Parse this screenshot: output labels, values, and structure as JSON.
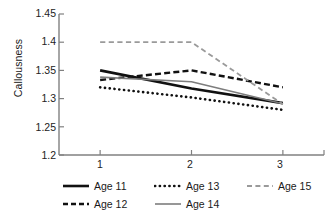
{
  "chart_data": {
    "type": "line",
    "title": "",
    "subtitle": "",
    "xlabel": "",
    "ylabel": "Callousness",
    "x": [
      1,
      2,
      3
    ],
    "categories": [
      "1",
      "2",
      "3"
    ],
    "xtick_labels": [
      "1",
      "2",
      "3"
    ],
    "ytick_labels": [
      "1.2",
      "1.25",
      "1.3",
      "1.35",
      "1.4",
      "1.45"
    ],
    "ytick_values": [
      1.2,
      1.25,
      1.3,
      1.35,
      1.4,
      1.45
    ],
    "ylim": [
      1.2,
      1.45
    ],
    "xlim": [
      0.55,
      3.45
    ],
    "grid": false,
    "legend_position": "bottom",
    "series": [
      {
        "name": "Age 11",
        "values": [
          1.35,
          1.318,
          1.292
        ],
        "color": "#111111",
        "style": "solid",
        "width": 2.6
      },
      {
        "name": "Age 12",
        "values": [
          1.333,
          1.35,
          1.32
        ],
        "color": "#111111",
        "style": "dashed",
        "width": 2.4
      },
      {
        "name": "Age 13",
        "values": [
          1.32,
          1.302,
          1.28
        ],
        "color": "#111111",
        "style": "dotted",
        "width": 2.6
      },
      {
        "name": "Age 14",
        "values": [
          1.338,
          1.33,
          1.291
        ],
        "color": "#7d7d7d",
        "style": "solid",
        "width": 1.6
      },
      {
        "name": "Age 15",
        "values": [
          1.4,
          1.4,
          1.29
        ],
        "color": "#9a9a9a",
        "style": "dashed",
        "width": 1.8
      }
    ]
  },
  "legend": {
    "rows": [
      [
        {
          "label": "Age 11",
          "swatch": "line-solid-black-thick"
        },
        {
          "label": "Age 13",
          "swatch": "line-dotted-black"
        },
        {
          "label": "Age 15",
          "swatch": "line-dashed-gray"
        }
      ],
      [
        {
          "label": "Age 12",
          "swatch": "line-dashed-black"
        },
        {
          "label": "Age 14",
          "swatch": "line-solid-gray"
        }
      ]
    ]
  },
  "axis": {
    "axis_color": "#808080",
    "text_color": "#222222"
  }
}
